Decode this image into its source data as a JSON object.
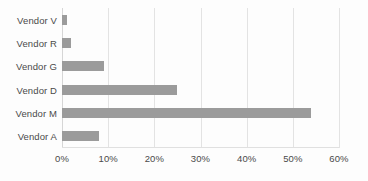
{
  "chart_data": {
    "type": "bar",
    "orientation": "horizontal",
    "title": "",
    "xlabel": "",
    "ylabel": "",
    "categories": [
      "Vendor V",
      "Vendor R",
      "Vendor G",
      "Vendor D",
      "Vendor M",
      "Vendor A"
    ],
    "values": [
      1,
      2,
      9,
      25,
      54,
      8
    ],
    "value_unit": "%",
    "xlim": [
      0,
      60
    ],
    "xticks": [
      0,
      10,
      20,
      30,
      40,
      50,
      60
    ],
    "xtick_labels": [
      "0%",
      "10%",
      "20%",
      "30%",
      "40%",
      "50%",
      "60%"
    ],
    "grid": "vertical",
    "legend": "none",
    "series": [
      {
        "name": "Share",
        "color": "#9b9b9b",
        "values": [
          1,
          2,
          9,
          25,
          54,
          8
        ]
      }
    ],
    "colors": {
      "bar": "#9b9b9b",
      "gridline": "#e3e3e3",
      "axis": "#d6d6d6",
      "text": "#4a4a4a",
      "background": "#fdfdfd"
    }
  }
}
